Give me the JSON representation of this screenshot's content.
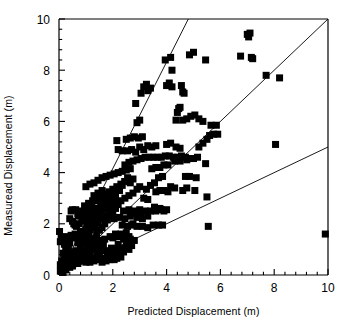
{
  "chart_data": {
    "type": "scatter",
    "title": "",
    "xlabel": "Predicted Displacement (m)",
    "ylabel": "Measuread Displacement (m)",
    "xlim": [
      0,
      10
    ],
    "ylim": [
      0,
      10
    ],
    "xticks": [
      0,
      2,
      4,
      6,
      8,
      10
    ],
    "yticks": [
      0,
      2,
      4,
      6,
      8,
      10
    ],
    "xtick_labels": [
      "0",
      "2",
      "4",
      "6",
      "8",
      "10"
    ],
    "ytick_labels": [
      "0",
      "2",
      "4",
      "6",
      "8",
      "10"
    ],
    "minor_ticks_per_interval": 4,
    "grid": false,
    "legend": null,
    "marker": {
      "shape": "square",
      "color": "#000000",
      "size_px": 7
    },
    "reference_lines": [
      {
        "name": "slope-2-line",
        "slope": 2.08,
        "intercept": 0,
        "color": "#000000"
      },
      {
        "name": "one-to-one-line",
        "slope": 1.0,
        "intercept": 0,
        "color": "#000000"
      },
      {
        "name": "slope-half-line",
        "slope": 0.5,
        "intercept": 0,
        "color": "#000000"
      }
    ],
    "points": [
      [
        0.05,
        0.15
      ],
      [
        0.1,
        0.2
      ],
      [
        0.15,
        0.1
      ],
      [
        0.2,
        0.3
      ],
      [
        0.12,
        0.45
      ],
      [
        0.25,
        0.2
      ],
      [
        0.3,
        0.35
      ],
      [
        0.18,
        0.6
      ],
      [
        0.35,
        0.5
      ],
      [
        0.4,
        0.3
      ],
      [
        0.22,
        0.8
      ],
      [
        0.45,
        0.65
      ],
      [
        0.5,
        0.45
      ],
      [
        0.3,
        0.95
      ],
      [
        0.55,
        0.8
      ],
      [
        0.6,
        0.6
      ],
      [
        0.35,
        1.1
      ],
      [
        0.65,
        0.95
      ],
      [
        0.7,
        0.75
      ],
      [
        0.4,
        1.25
      ],
      [
        0.05,
        1.3
      ],
      [
        0.08,
        1.45
      ],
      [
        0.02,
        1.7
      ],
      [
        0.15,
        1.35
      ],
      [
        0.25,
        1.5
      ],
      [
        0.35,
        1.4
      ],
      [
        0.45,
        1.55
      ],
      [
        0.55,
        1.45
      ],
      [
        0.2,
        1.2
      ],
      [
        0.3,
        1.15
      ],
      [
        0.75,
        0.9
      ],
      [
        0.8,
        1.05
      ],
      [
        0.85,
        0.8
      ],
      [
        0.9,
        1.2
      ],
      [
        0.95,
        0.95
      ],
      [
        1.0,
        1.3
      ],
      [
        0.6,
        1.6
      ],
      [
        0.7,
        1.5
      ],
      [
        0.8,
        1.7
      ],
      [
        0.9,
        1.6
      ],
      [
        1.0,
        1.8
      ],
      [
        1.1,
        1.55
      ],
      [
        0.65,
        1.9
      ],
      [
        0.75,
        2.0
      ],
      [
        0.85,
        2.1
      ],
      [
        0.7,
        2.4
      ],
      [
        0.8,
        2.5
      ],
      [
        0.9,
        2.45
      ],
      [
        0.62,
        2.55
      ],
      [
        0.72,
        2.3
      ],
      [
        1.05,
        2.0
      ],
      [
        1.15,
        2.2
      ],
      [
        1.2,
        1.9
      ],
      [
        1.25,
        2.35
      ],
      [
        1.3,
        2.1
      ],
      [
        1.35,
        2.5
      ],
      [
        1.4,
        2.25
      ],
      [
        1.45,
        2.6
      ],
      [
        1.5,
        2.4
      ],
      [
        1.55,
        2.7
      ],
      [
        1.6,
        2.5
      ],
      [
        1.65,
        2.85
      ],
      [
        1.7,
        2.6
      ],
      [
        1.75,
        2.95
      ],
      [
        1.8,
        2.75
      ],
      [
        1.85,
        3.05
      ],
      [
        1.9,
        2.85
      ],
      [
        1.95,
        3.15
      ],
      [
        2.0,
        2.95
      ],
      [
        2.05,
        3.25
      ],
      [
        2.1,
        3.05
      ],
      [
        2.15,
        3.35
      ],
      [
        1.1,
        1.1
      ],
      [
        1.2,
        1.3
      ],
      [
        1.3,
        1.45
      ],
      [
        1.4,
        1.6
      ],
      [
        1.5,
        1.75
      ],
      [
        1.6,
        1.85
      ],
      [
        1.7,
        2.0
      ],
      [
        1.8,
        2.15
      ],
      [
        1.9,
        2.3
      ],
      [
        2.0,
        2.45
      ],
      [
        2.1,
        2.6
      ],
      [
        2.2,
        2.75
      ],
      [
        1.15,
        0.85
      ],
      [
        1.25,
        1.0
      ],
      [
        1.35,
        1.15
      ],
      [
        1.45,
        1.3
      ],
      [
        1.55,
        1.05
      ],
      [
        1.65,
        1.2
      ],
      [
        1.05,
        0.7
      ],
      [
        1.2,
        0.65
      ],
      [
        1.4,
        0.75
      ],
      [
        1.6,
        0.65
      ],
      [
        1.8,
        0.7
      ],
      [
        2.0,
        0.8
      ],
      [
        2.2,
        0.75
      ],
      [
        2.4,
        0.9
      ],
      [
        2.3,
        1.05
      ],
      [
        2.5,
        1.15
      ],
      [
        2.6,
        1.0
      ],
      [
        2.7,
        1.15
      ],
      [
        1.3,
        3.1
      ],
      [
        1.45,
        3.2
      ],
      [
        1.6,
        3.3
      ],
      [
        1.1,
        2.8
      ],
      [
        1.25,
        2.9
      ],
      [
        0.95,
        2.7
      ],
      [
        1.0,
        3.45
      ],
      [
        1.15,
        3.55
      ],
      [
        1.3,
        3.6
      ],
      [
        1.45,
        3.7
      ],
      [
        1.6,
        3.8
      ],
      [
        1.75,
        3.85
      ],
      [
        1.9,
        3.9
      ],
      [
        2.05,
        3.95
      ],
      [
        2.2,
        4.0
      ],
      [
        2.35,
        4.05
      ],
      [
        2.5,
        4.1
      ],
      [
        2.65,
        4.15
      ],
      [
        2.25,
        3.3
      ],
      [
        2.35,
        3.5
      ],
      [
        2.45,
        3.65
      ],
      [
        2.55,
        3.8
      ],
      [
        2.65,
        3.6
      ],
      [
        2.75,
        3.75
      ],
      [
        2.3,
        2.9
      ],
      [
        2.45,
        3.0
      ],
      [
        2.6,
        3.1
      ],
      [
        2.75,
        3.2
      ],
      [
        2.9,
        3.35
      ],
      [
        3.0,
        3.45
      ],
      [
        2.4,
        2.5
      ],
      [
        2.6,
        2.55
      ],
      [
        2.8,
        2.5
      ],
      [
        3.0,
        2.55
      ],
      [
        3.2,
        2.5
      ],
      [
        3.4,
        2.5
      ],
      [
        3.6,
        2.5
      ],
      [
        3.8,
        2.55
      ],
      [
        3.9,
        2.5
      ],
      [
        2.9,
        2.25
      ],
      [
        3.1,
        2.2
      ],
      [
        3.3,
        2.3
      ],
      [
        2.35,
        1.95
      ],
      [
        2.55,
        1.9
      ],
      [
        2.75,
        2.0
      ],
      [
        3.5,
        1.95
      ],
      [
        3.7,
        1.95
      ],
      [
        3.85,
        1.95
      ],
      [
        2.0,
        1.45
      ],
      [
        2.2,
        1.5
      ],
      [
        2.4,
        1.4
      ],
      [
        2.6,
        1.5
      ],
      [
        2.8,
        1.35
      ],
      [
        2.2,
        1.2
      ],
      [
        2.05,
        0.9
      ],
      [
        2.15,
        0.65
      ],
      [
        2.3,
        0.7
      ],
      [
        2.05,
        0.6
      ],
      [
        1.9,
        0.6
      ],
      [
        1.75,
        0.55
      ],
      [
        2.45,
        4.3
      ],
      [
        2.6,
        4.4
      ],
      [
        2.75,
        4.45
      ],
      [
        2.9,
        4.5
      ],
      [
        3.05,
        4.55
      ],
      [
        3.2,
        4.6
      ],
      [
        3.35,
        4.6
      ],
      [
        3.5,
        4.6
      ],
      [
        3.65,
        4.6
      ],
      [
        3.8,
        4.6
      ],
      [
        3.95,
        4.65
      ],
      [
        4.1,
        4.65
      ],
      [
        4.25,
        4.6
      ],
      [
        4.4,
        4.6
      ],
      [
        4.55,
        4.65
      ],
      [
        4.7,
        4.6
      ],
      [
        2.55,
        4.85
      ],
      [
        2.7,
        4.9
      ],
      [
        2.85,
        4.8
      ],
      [
        3.0,
        5.0
      ],
      [
        3.15,
        4.9
      ],
      [
        3.3,
        5.05
      ],
      [
        3.45,
        5.0
      ],
      [
        3.6,
        5.05
      ],
      [
        4.0,
        5.1
      ],
      [
        4.15,
        5.15
      ],
      [
        4.35,
        5.0
      ],
      [
        4.5,
        4.95
      ],
      [
        2.35,
        4.85
      ],
      [
        2.2,
        4.9
      ],
      [
        2.15,
        5.25
      ],
      [
        2.5,
        5.3
      ],
      [
        2.65,
        5.35
      ],
      [
        2.8,
        5.4
      ],
      [
        2.95,
        5.35
      ],
      [
        3.1,
        5.4
      ],
      [
        2.9,
        5.95
      ],
      [
        3.0,
        6.05
      ],
      [
        2.85,
        6.7
      ],
      [
        3.05,
        7.1
      ],
      [
        3.15,
        7.35
      ],
      [
        3.25,
        7.45
      ],
      [
        3.3,
        7.2
      ],
      [
        3.4,
        7.3
      ],
      [
        4.0,
        7.4
      ],
      [
        4.1,
        7.5
      ],
      [
        4.2,
        7.35
      ],
      [
        4.55,
        7.4
      ],
      [
        4.6,
        7.15
      ],
      [
        4.65,
        7.1
      ],
      [
        3.95,
        8.4
      ],
      [
        4.2,
        8.0
      ],
      [
        4.15,
        8.5
      ],
      [
        5.0,
        8.7
      ],
      [
        4.85,
        8.6
      ],
      [
        5.45,
        8.4
      ],
      [
        6.75,
        8.55
      ],
      [
        7.0,
        9.4
      ],
      [
        7.1,
        9.45
      ],
      [
        7.05,
        9.3
      ],
      [
        7.2,
        8.45
      ],
      [
        7.15,
        8.5
      ],
      [
        7.7,
        7.8
      ],
      [
        8.2,
        7.7
      ],
      [
        8.05,
        5.1
      ],
      [
        9.9,
        1.6
      ],
      [
        5.55,
        1.9
      ],
      [
        5.45,
        4.35
      ],
      [
        5.5,
        3.05
      ],
      [
        5.05,
        3.3
      ],
      [
        4.75,
        3.4
      ],
      [
        4.6,
        3.3
      ],
      [
        4.3,
        3.4
      ],
      [
        4.15,
        3.45
      ],
      [
        4.05,
        3.25
      ],
      [
        4.7,
        3.85
      ],
      [
        4.85,
        3.85
      ],
      [
        5.1,
        3.8
      ],
      [
        4.3,
        4.45
      ],
      [
        4.5,
        4.45
      ],
      [
        4.75,
        4.5
      ],
      [
        4.9,
        4.55
      ],
      [
        5.0,
        4.55
      ],
      [
        5.15,
        4.6
      ],
      [
        5.2,
        5.0
      ],
      [
        5.35,
        5.15
      ],
      [
        5.5,
        5.3
      ],
      [
        5.6,
        5.45
      ],
      [
        5.75,
        5.5
      ],
      [
        5.65,
        5.85
      ],
      [
        4.6,
        6.05
      ],
      [
        4.75,
        6.1
      ],
      [
        4.9,
        6.2
      ],
      [
        5.05,
        6.25
      ],
      [
        5.2,
        6.1
      ],
      [
        5.35,
        6.0
      ],
      [
        4.35,
        6.05
      ],
      [
        4.4,
        6.35
      ],
      [
        4.45,
        6.5
      ],
      [
        4.5,
        6.55
      ],
      [
        5.85,
        5.85
      ],
      [
        5.9,
        5.5
      ],
      [
        3.55,
        3.6
      ],
      [
        3.7,
        3.8
      ],
      [
        3.85,
        3.85
      ],
      [
        3.4,
        3.5
      ],
      [
        3.25,
        3.35
      ],
      [
        3.45,
        4.15
      ],
      [
        3.6,
        4.2
      ],
      [
        3.75,
        4.2
      ],
      [
        3.9,
        4.3
      ],
      [
        4.05,
        4.3
      ],
      [
        3.15,
        3.0
      ],
      [
        3.3,
        2.95
      ],
      [
        0.45,
        2.5
      ],
      [
        0.5,
        2.55
      ],
      [
        0.4,
        2.2
      ],
      [
        0.5,
        2.1
      ],
      [
        0.55,
        2.0
      ],
      [
        0.6,
        1.95
      ],
      [
        0.25,
        1.0
      ],
      [
        0.35,
        0.8
      ],
      [
        0.15,
        0.85
      ],
      [
        0.45,
        0.9
      ],
      [
        0.1,
        0.55
      ],
      [
        0.05,
        0.4
      ],
      [
        0.3,
        0.55
      ],
      [
        0.2,
        0.45
      ],
      [
        0.4,
        0.45
      ],
      [
        0.6,
        0.55
      ],
      [
        0.7,
        0.45
      ],
      [
        0.5,
        0.35
      ],
      [
        0.85,
        0.55
      ],
      [
        1.0,
        0.5
      ],
      [
        1.15,
        0.5
      ],
      [
        1.3,
        0.55
      ],
      [
        1.45,
        0.6
      ],
      [
        1.6,
        0.5
      ],
      [
        0.95,
        1.45
      ],
      [
        1.05,
        1.6
      ],
      [
        1.15,
        1.75
      ],
      [
        0.9,
        1.4
      ],
      [
        0.8,
        1.35
      ],
      [
        0.7,
        1.25
      ],
      [
        1.5,
        1.35
      ],
      [
        1.7,
        1.4
      ],
      [
        1.9,
        1.5
      ],
      [
        2.1,
        1.6
      ],
      [
        2.3,
        1.6
      ],
      [
        2.5,
        1.65
      ],
      [
        1.25,
        2.45
      ],
      [
        1.35,
        2.6
      ],
      [
        1.2,
        2.7
      ],
      [
        1.1,
        2.45
      ],
      [
        1.0,
        2.35
      ],
      [
        0.95,
        2.2
      ],
      [
        1.55,
        3.05
      ],
      [
        1.7,
        3.15
      ],
      [
        1.85,
        3.25
      ],
      [
        2.0,
        3.35
      ],
      [
        2.15,
        3.45
      ],
      [
        2.3,
        3.55
      ],
      [
        2.45,
        3.65
      ],
      [
        2.6,
        3.7
      ],
      [
        1.4,
        2.9
      ],
      [
        1.5,
        2.95
      ],
      [
        1.65,
        2.85
      ],
      [
        1.8,
        2.9
      ],
      [
        1.95,
        2.6
      ],
      [
        2.05,
        2.7
      ],
      [
        2.15,
        2.8
      ],
      [
        1.85,
        2.45
      ],
      [
        1.75,
        2.3
      ],
      [
        1.6,
        2.2
      ],
      [
        1.45,
        2.05
      ],
      [
        1.35,
        1.95
      ],
      [
        1.25,
        1.85
      ],
      [
        1.15,
        1.95
      ],
      [
        1.05,
        2.05
      ],
      [
        2.05,
        2.2
      ],
      [
        2.25,
        2.25
      ],
      [
        2.45,
        2.2
      ],
      [
        2.65,
        2.3
      ],
      [
        2.85,
        2.4
      ],
      [
        3.05,
        2.4
      ],
      [
        2.7,
        1.95
      ],
      [
        2.9,
        1.9
      ],
      [
        3.1,
        1.9
      ],
      [
        3.3,
        1.85
      ],
      [
        2.5,
        1.45
      ],
      [
        2.65,
        1.4
      ],
      [
        1.95,
        1.05
      ],
      [
        2.1,
        1.0
      ],
      [
        2.25,
        0.95
      ],
      [
        1.8,
        0.95
      ],
      [
        1.65,
        0.95
      ],
      [
        1.5,
        0.9
      ],
      [
        3.6,
        3.25
      ],
      [
        3.75,
        3.3
      ],
      [
        3.9,
        3.3
      ],
      [
        4.0,
        2.55
      ],
      [
        3.75,
        2.6
      ],
      [
        3.55,
        2.65
      ]
    ]
  }
}
